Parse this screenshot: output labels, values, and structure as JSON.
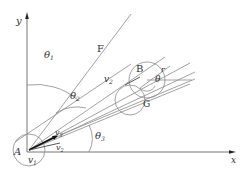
{
  "diagram": {
    "axes": {
      "x_label": "x",
      "y_label": "y",
      "line_color": "#555555",
      "arrow_color": "#222222"
    },
    "points": {
      "A": {
        "label": "A",
        "velocity_label": "v",
        "velocity_sub": "1"
      },
      "B": {
        "label": "B",
        "velocity_label": "v",
        "velocity_sub": "2",
        "radius_label": "r",
        "angle_label": "θ"
      },
      "F": {
        "label": "F"
      },
      "G": {
        "label": "G"
      }
    },
    "angles": {
      "theta1": {
        "symbol": "θ",
        "sub": "1"
      },
      "theta2": {
        "symbol": "θ",
        "sub": "2"
      },
      "theta3": {
        "symbol": "θ",
        "sub": "3"
      }
    },
    "vectors_at_A": {
      "v2": {
        "symbol": "v",
        "sub": "2"
      },
      "v3": {
        "symbol": "v",
        "sub": "3"
      }
    },
    "colors": {
      "line": "#8a8a8a",
      "text": "#333333",
      "dark_vector": "#111111"
    }
  }
}
